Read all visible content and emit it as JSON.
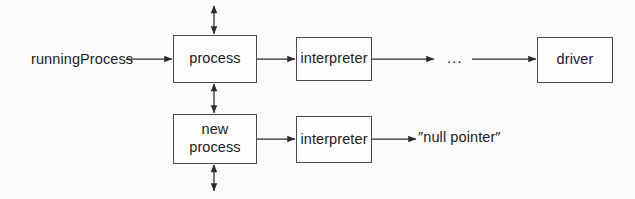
{
  "diagram": {
    "background_color": "#fbfbfb",
    "stroke_color": "#4a4a4a",
    "text_color": "#1c1c1c",
    "nodes": [
      {
        "id": "process",
        "label": "process",
        "shape": "rectangle"
      },
      {
        "id": "interpreter_1",
        "label": "interpreter",
        "shape": "rectangle"
      },
      {
        "id": "driver",
        "label": "driver",
        "shape": "rectangle"
      },
      {
        "id": "new_process",
        "label": "new\nprocess",
        "shape": "rectangle"
      },
      {
        "id": "interpreter_2",
        "label": "interpreter",
        "shape": "rectangle"
      }
    ],
    "labels": {
      "running_process": "runningProcess",
      "null_pointer": "″null pointer″",
      "ellipsis": "..."
    },
    "edges": [
      {
        "from": "runningProcess",
        "to": "process",
        "arrow": "single",
        "direction": "right"
      },
      {
        "from": "process",
        "to": "interpreter_1",
        "arrow": "single",
        "direction": "right"
      },
      {
        "from": "interpreter_1",
        "to": "ellipsis",
        "arrow": "single",
        "direction": "right"
      },
      {
        "from": "ellipsis",
        "to": "driver",
        "arrow": "single",
        "direction": "right"
      },
      {
        "from": "above",
        "to": "process",
        "arrow": "double",
        "direction": "vertical"
      },
      {
        "from": "process",
        "to": "new_process",
        "arrow": "double",
        "direction": "vertical"
      },
      {
        "from": "new_process",
        "to": "below",
        "arrow": "double",
        "direction": "vertical"
      },
      {
        "from": "new_process",
        "to": "interpreter_2",
        "arrow": "single",
        "direction": "right"
      },
      {
        "from": "interpreter_2",
        "to": "null_pointer",
        "arrow": "single",
        "direction": "right"
      }
    ]
  }
}
